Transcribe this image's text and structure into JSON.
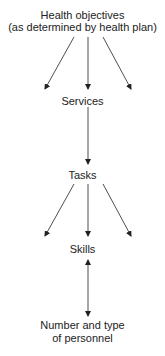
{
  "diagram": {
    "nodes": [
      {
        "id": "objectives",
        "line1": "Health objectives",
        "line2": "(as determined by health plan)"
      },
      {
        "id": "services",
        "label": "Services"
      },
      {
        "id": "tasks",
        "label": "Tasks"
      },
      {
        "id": "skills",
        "label": "Skills"
      },
      {
        "id": "personnel",
        "line1": "Number and type",
        "line2": "of personnel"
      }
    ],
    "edges": [
      {
        "from": "objectives",
        "to": "services",
        "style": "three-arrows-fan"
      },
      {
        "from": "services",
        "to": "tasks",
        "style": "single-arrow"
      },
      {
        "from": "tasks",
        "to": "skills",
        "style": "three-arrows-fan"
      },
      {
        "from": "skills",
        "to": "personnel",
        "style": "double-headed-arrow"
      }
    ]
  }
}
